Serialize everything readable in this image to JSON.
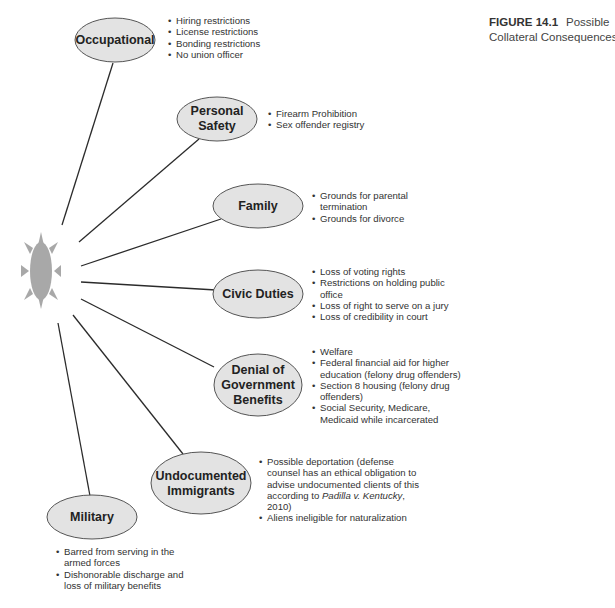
{
  "caption": {
    "figure_number": "FIGURE 14.1",
    "title_line1": "Possible",
    "title_line2": "Collateral Consequences"
  },
  "center": {
    "icon": "sun-icon",
    "color": "#a8a8a8"
  },
  "colors": {
    "node_fill": "#e3e3e3",
    "node_stroke": "#555555",
    "line": "#2b2b2b"
  },
  "nodes": [
    {
      "label": "Occupational",
      "bullets": [
        "Hiring restrictions",
        "License restrictions",
        "Bonding restrictions",
        "No union officer"
      ]
    },
    {
      "label": "Personal Safety",
      "bullets": [
        "Firearm Prohibition",
        "Sex offender registry"
      ]
    },
    {
      "label": "Family",
      "bullets": [
        "Grounds for parental termination",
        "Grounds for divorce"
      ]
    },
    {
      "label": "Civic Duties",
      "bullets": [
        "Loss of voting rights",
        "Restrictions on holding public office",
        "Loss of right to serve on a jury",
        "Loss of credibility in court"
      ]
    },
    {
      "label": "Denial of Government Benefits",
      "bullets": [
        "Welfare",
        "Federal financial aid for higher education (felony drug offenders)",
        "Section 8 housing (felony drug offenders)",
        "Social Security, Medicare, Medicaid while incarcerated"
      ]
    },
    {
      "label": "Undocumented Immigrants",
      "bullets": [
        "Possible deportation (defense counsel has an ethical obligation to advise undocumented clients of this according to Padilla v. Kentucky, 2010)",
        "Aliens ineligible for naturalization"
      ]
    },
    {
      "label": "Military",
      "bullets": [
        "Barred from serving in the armed forces",
        "Dishonorable discharge and loss of military benefits"
      ]
    }
  ]
}
